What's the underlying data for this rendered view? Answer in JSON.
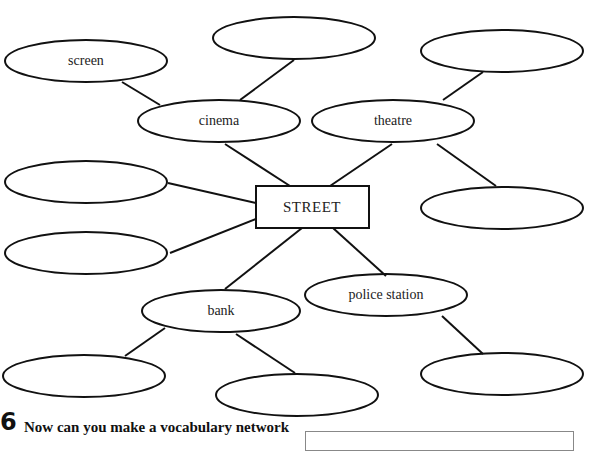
{
  "network": {
    "hub": "STREET",
    "nodes": {
      "cinema": "cinema",
      "theatre": "theatre",
      "bank": "bank",
      "police_station": "police station",
      "screen": "screen",
      "cinema_blank": "",
      "theatre_top_blank": "",
      "theatre_bottom_blank": "",
      "street_left_top_blank": "",
      "street_left_bottom_blank": "",
      "bank_left_blank": "",
      "bank_right_blank": "",
      "police_blank": ""
    }
  },
  "exercise": {
    "number": "6",
    "instruction": "Now can you make a vocabulary network"
  }
}
